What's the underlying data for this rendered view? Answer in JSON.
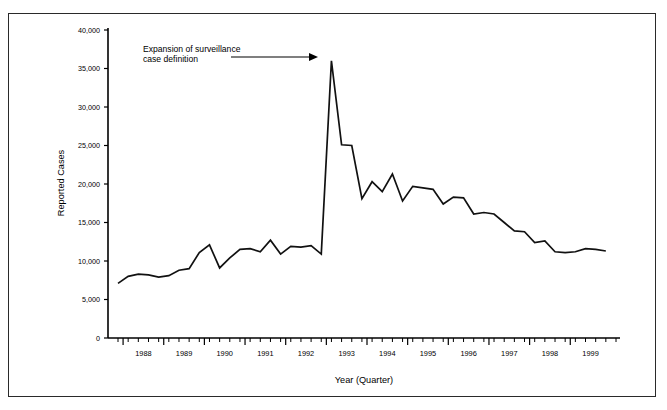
{
  "figure": {
    "border_color": "#2a2a2a",
    "background": "#ffffff",
    "line_color": "#111111"
  },
  "axis": {
    "ylabel": "Reported Cases",
    "xlabel": "Year (Quarter)"
  },
  "annotation": {
    "line1": "Expansion of surveillance",
    "line2": "case definition"
  },
  "chart_data": {
    "type": "line",
    "title": "",
    "xlabel": "Year (Quarter)",
    "ylabel": "Reported Cases",
    "ylim": [
      0,
      40000
    ],
    "xlim": [
      "1987 Q4",
      "1999 Q4"
    ],
    "grid": false,
    "legend": null,
    "ytick_labels": [
      "0",
      "5,000",
      "10,000",
      "15,000",
      "20,000",
      "25,000",
      "30,000",
      "35,000",
      "40,000"
    ],
    "ytick_values": [
      0,
      5000,
      10000,
      15000,
      20000,
      25000,
      30000,
      35000,
      40000
    ],
    "xtick_labels": [
      "1988",
      "1989",
      "1990",
      "1991",
      "1992",
      "1993",
      "1994",
      "1995",
      "1996",
      "1997",
      "1998",
      "1999"
    ],
    "xtick_values": [
      1988,
      1989,
      1990,
      1991,
      1992,
      1993,
      1994,
      1995,
      1996,
      1997,
      1998,
      1999
    ],
    "minor_ticks": "quarterly",
    "annotations": [
      {
        "text": "Expansion of surveillance case definition",
        "points_to": "1993 Q1",
        "points_to_value": 36000
      }
    ],
    "x": [
      "1987 Q4",
      "1988 Q1",
      "1988 Q2",
      "1988 Q3",
      "1988 Q4",
      "1989 Q1",
      "1989 Q2",
      "1989 Q3",
      "1989 Q4",
      "1990 Q1",
      "1990 Q2",
      "1990 Q3",
      "1990 Q4",
      "1991 Q1",
      "1991 Q2",
      "1991 Q3",
      "1991 Q4",
      "1992 Q1",
      "1992 Q2",
      "1992 Q3",
      "1992 Q4",
      "1993 Q1",
      "1993 Q2",
      "1993 Q3",
      "1993 Q4",
      "1994 Q1",
      "1994 Q2",
      "1994 Q3",
      "1994 Q4",
      "1995 Q1",
      "1995 Q2",
      "1995 Q3",
      "1995 Q4",
      "1996 Q1",
      "1996 Q2",
      "1996 Q3",
      "1996 Q4",
      "1997 Q1",
      "1997 Q2",
      "1997 Q3",
      "1997 Q4",
      "1998 Q1",
      "1998 Q2",
      "1998 Q3",
      "1998 Q4",
      "1999 Q1",
      "1999 Q2",
      "1999 Q3",
      "1999 Q4"
    ],
    "values": [
      7100,
      8000,
      8300,
      8200,
      7900,
      8100,
      8800,
      9000,
      11100,
      12100,
      9100,
      10400,
      11500,
      11600,
      11200,
      12700,
      10900,
      11900,
      11800,
      12000,
      10900,
      36000,
      25100,
      25000,
      18100,
      20300,
      19000,
      21300,
      17800,
      19700,
      19500,
      19300,
      17400,
      18300,
      18200,
      16100,
      16300,
      16100,
      15000,
      13900,
      13800,
      12400,
      12600,
      11200,
      11100,
      11200,
      11600,
      11500,
      11300
    ],
    "series": [
      {
        "name": "Reported Cases",
        "values": [
          7100,
          8000,
          8300,
          8200,
          7900,
          8100,
          8800,
          9000,
          11100,
          12100,
          9100,
          10400,
          11500,
          11600,
          11200,
          12700,
          10900,
          11900,
          11800,
          12000,
          10900,
          36000,
          25100,
          25000,
          18100,
          20300,
          19000,
          21300,
          17800,
          19700,
          19500,
          19300,
          17400,
          18300,
          18200,
          16100,
          16300,
          16100,
          15000,
          13900,
          13800,
          12400,
          12600,
          11200,
          11100,
          11200,
          11600,
          11500,
          11300
        ]
      }
    ]
  }
}
